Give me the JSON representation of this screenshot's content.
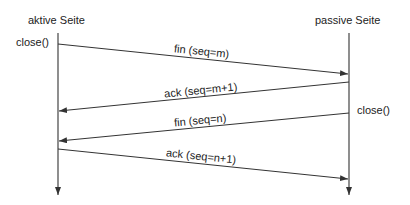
{
  "diagram": {
    "type": "sequence",
    "participants": [
      {
        "id": "left",
        "label": "aktive Seite"
      },
      {
        "id": "right",
        "label": "passive Seite"
      }
    ],
    "annotations": [
      {
        "side": "left",
        "text": "close()"
      },
      {
        "side": "right",
        "text": "close()"
      }
    ],
    "messages": [
      {
        "from": "left",
        "to": "right",
        "label": "fin (seq=m)"
      },
      {
        "from": "right",
        "to": "left",
        "label": "ack (seq=m+1)"
      },
      {
        "from": "right",
        "to": "left",
        "label": "fin (seq=n)"
      },
      {
        "from": "left",
        "to": "right",
        "label": "ack (seq=n+1)"
      }
    ],
    "colors": {
      "line": "#333333",
      "text": "#222222",
      "background": "#ffffff"
    }
  }
}
